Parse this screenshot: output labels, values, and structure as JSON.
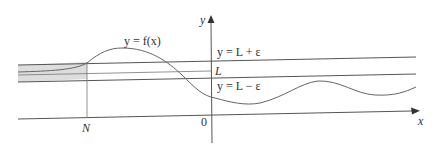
{
  "diagram": {
    "type": "limit-at-negative-infinity illustration",
    "labels": {
      "y_axis": "y",
      "x_axis": "x",
      "origin": "0",
      "curve": "y = f(x)",
      "upper_band": "y = L + ε",
      "lower_band": "y = L − ε",
      "limit": "L",
      "n_marker": "N"
    },
    "colors": {
      "axis": "#555555",
      "curve": "#666666",
      "band_lines": "#555555",
      "shade": "#d9d9d9",
      "text": "#333333"
    }
  }
}
